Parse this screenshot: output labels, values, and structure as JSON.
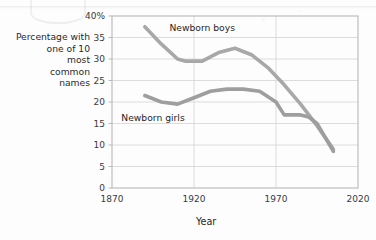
{
  "figure": {
    "background_color": "#fdfdfd",
    "plot_border_color": "#b9b9b9",
    "gridline_color": "#d8d8d8"
  },
  "y_axis_title": "Percentage with\none of 10\nmost\ncommon\nnames",
  "x_axis_title": "Year",
  "chart_data": {
    "type": "line",
    "title": "",
    "xlabel": "Year",
    "ylabel": "Percentage with one of 10 most common names",
    "xlim": [
      1870,
      2020
    ],
    "ylim": [
      0,
      40
    ],
    "xticks": [
      1870,
      1920,
      1970,
      2020
    ],
    "xtick_labels": [
      "1870",
      "1920",
      "1970",
      "2020"
    ],
    "yticks": [
      0,
      5,
      10,
      15,
      20,
      25,
      30,
      35,
      40
    ],
    "ytick_labels": [
      "0",
      "5",
      "10",
      "15",
      "20",
      "25",
      "30",
      "35",
      "40%"
    ],
    "grid": true,
    "grid_axis": "y",
    "legend": "inline-labels",
    "series": [
      {
        "name": "Newborn boys",
        "color": "#a8a8a8",
        "label_x": 1925,
        "label_y": 36.5,
        "x": [
          1890,
          1900,
          1910,
          1915,
          1925,
          1935,
          1945,
          1955,
          1965,
          1975,
          1985,
          1995,
          2005
        ],
        "values": [
          37.5,
          33.5,
          30.0,
          29.5,
          29.5,
          31.5,
          32.5,
          31.0,
          28.0,
          24.0,
          19.5,
          14.5,
          9.0
        ]
      },
      {
        "name": "Newborn girls",
        "color": "#9e9e9e",
        "label_x": 1895,
        "label_y": 15.5,
        "x": [
          1890,
          1900,
          1910,
          1920,
          1930,
          1940,
          1950,
          1960,
          1970,
          1975,
          1985,
          1990,
          1995,
          2005
        ],
        "values": [
          21.5,
          20.0,
          19.5,
          21.0,
          22.5,
          23.0,
          23.0,
          22.5,
          20.0,
          17.0,
          17.0,
          16.5,
          15.0,
          8.5
        ]
      }
    ]
  }
}
